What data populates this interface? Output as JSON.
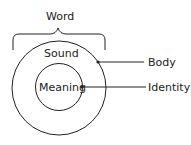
{
  "diagram": {
    "title_label": "Word",
    "outer_circle_label": "Sound",
    "inner_circle_label": "Meaning",
    "callouts": {
      "outer": "Body",
      "inner": "Identity"
    },
    "colors": {
      "stroke": "#222222",
      "text": "#222222",
      "background": "#ffffff"
    }
  }
}
